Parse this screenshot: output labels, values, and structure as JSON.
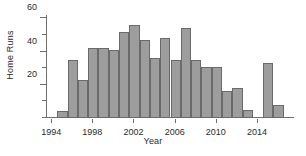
{
  "chart_data": {
    "type": "bar",
    "title": "",
    "xlabel": "Year",
    "ylabel": "Home Runs",
    "categories": [
      1995,
      1996,
      1997,
      1998,
      1999,
      2000,
      2001,
      2002,
      2003,
      2004,
      2005,
      2006,
      2007,
      2008,
      2009,
      2010,
      2011,
      2012,
      2013,
      2014,
      2015,
      2016
    ],
    "values": [
      4,
      35,
      23,
      42,
      42,
      41,
      52,
      56,
      47,
      36,
      48,
      35,
      54,
      35,
      31,
      31,
      16,
      18,
      5,
      0,
      33,
      8
    ],
    "series": [
      {
        "name": "Home Runs",
        "values": [
          4,
          35,
          23,
          42,
          42,
          41,
          52,
          56,
          47,
          36,
          48,
          35,
          54,
          35,
          31,
          31,
          16,
          18,
          5,
          0,
          33,
          8
        ]
      }
    ],
    "xlim": [
      1994,
      1917
    ],
    "ylim": [
      0,
      62
    ],
    "x_ticks": [
      1994,
      1998,
      2002,
      2006,
      2010,
      2014
    ],
    "x_tick_labels": [
      "1994",
      "1998",
      "2002",
      "2006",
      "2010",
      "2014"
    ],
    "y_ticks": [
      0,
      10,
      20,
      30,
      40,
      50,
      60
    ],
    "y_tick_labels_major": [
      "20",
      "40",
      "60"
    ],
    "y_major_ticks": [
      20,
      40,
      60
    ],
    "y_minor_ticks": [
      0,
      10,
      30,
      50
    ],
    "grid": false,
    "legend": false,
    "bar_color": "#9d9d9d",
    "bar_edge_color": "#6a6a6a",
    "axis_color": "#6f6f6f",
    "text_color": "#2b2b2b",
    "background": "#ffffff"
  },
  "axes": {
    "y_title": "Home Runs",
    "x_title": "Year"
  },
  "y_labels": [
    {
      "value": 60,
      "text": "60"
    },
    {
      "value": 40,
      "text": "40"
    },
    {
      "value": 20,
      "text": "20"
    }
  ],
  "x_labels": [
    {
      "value": 1994,
      "text": "1994"
    },
    {
      "value": 1998,
      "text": "1998"
    },
    {
      "value": 2002,
      "text": "2002"
    },
    {
      "value": 2006,
      "text": "2006"
    },
    {
      "value": 2010,
      "text": "2010"
    },
    {
      "value": 2014,
      "text": "2014"
    }
  ]
}
